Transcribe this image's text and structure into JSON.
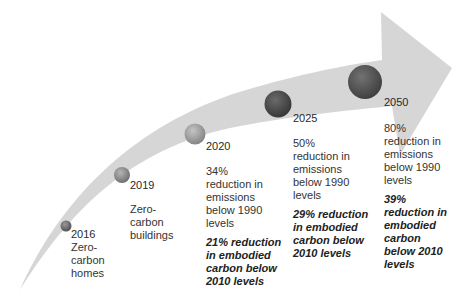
{
  "diagram": {
    "type": "timeline-arrow",
    "arrow_color": "#d6d6d6",
    "milestones": [
      {
        "year": "2016",
        "description": "Zero-carbon homes",
        "desc_lines": [
          "Zero-",
          "carbon",
          "homes"
        ],
        "dot_color": "#6e6e6e"
      },
      {
        "year": "2019",
        "description": "Zero-carbon buildings",
        "desc_lines": [
          "Zero-",
          "carbon",
          "buildings"
        ],
        "dot_color": "#8a8a8a"
      },
      {
        "year": "2020",
        "description": "34% reduction in emissions below 1990 levels",
        "desc_lines": [
          "34%",
          "reduction in",
          "emissions",
          "below 1990",
          "levels"
        ],
        "embodied": "21% reduction in embodied carbon below 2010 levels",
        "embodied_lines": [
          "21% reduction",
          "in embodied",
          "carbon below",
          "2010 levels"
        ],
        "dot_color": "#a0a0a0"
      },
      {
        "year": "2025",
        "description": "50% reduction in emissions below 1990 levels",
        "desc_lines": [
          "50%",
          "reduction in",
          "emissions",
          "below 1990",
          "levels"
        ],
        "embodied": "29% reduction in embodied carbon below 2010 levels",
        "embodied_lines": [
          "29% reduction",
          "in embodied",
          "carbon below",
          "2010 levels"
        ],
        "dot_color": "#4a4a4a"
      },
      {
        "year": "2050",
        "description": "80% reduction in emissions below 1990 levels",
        "desc_lines": [
          "80%",
          "reduction in",
          "emissions",
          "below 1990",
          "levels"
        ],
        "embodied": "39% reduction in embodied carbon below 2010 levels",
        "embodied_lines": [
          "39%",
          "reduction in",
          "embodied",
          "carbon",
          "below 2010",
          "levels"
        ],
        "dot_color": "#565656"
      }
    ]
  }
}
